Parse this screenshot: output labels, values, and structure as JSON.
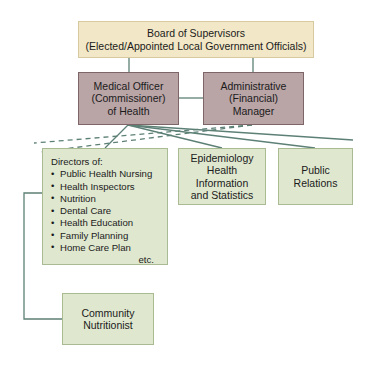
{
  "diagram": {
    "colors": {
      "board_fill": "#f2e7c6",
      "board_border": "#d9c9a0",
      "officer_fill": "#b9a4a6",
      "officer_border": "#7e6668",
      "unit_fill": "#dfe7cf",
      "unit_border": "#a8bb93",
      "connector_solid": "#5d8076",
      "connector_dashed": "#5d8076",
      "background": "#ffffff",
      "text": "#1b1b1b"
    }
  },
  "nodes": {
    "board": {
      "line1": "Board of Supervisors",
      "line2": "(Elected/Appointed Local Government Officials)"
    },
    "medical_officer": {
      "line1": "Medical Officer",
      "line2": "(Commissioner)",
      "line3": "of Health"
    },
    "admin_manager": {
      "line1": "Administrative",
      "line2": "(Financial)",
      "line3": "Manager"
    },
    "directors": {
      "heading": "Directors of:",
      "items": [
        "Public Health Nursing",
        "Health Inspectors",
        "Nutrition",
        "Dental Care",
        "Health Education",
        "Family Planning",
        "Home Care Plan"
      ],
      "etc": "etc."
    },
    "epidemiology": {
      "line1": "Epidemiology",
      "line2": "Health",
      "line3": "Information",
      "line4": "and Statistics"
    },
    "public_relations": {
      "line1": "Public",
      "line2": "Relations"
    },
    "community_nutritionist": {
      "line1": "Community",
      "line2": "Nutritionist"
    }
  }
}
